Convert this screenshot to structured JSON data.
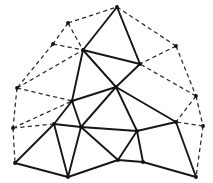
{
  "figure": {
    "type": "planar-triangulation",
    "width": 213,
    "height": 183,
    "background_color": "#ffffff"
  },
  "style": {
    "solid_edge_color": "#171717",
    "solid_edge_width": 1.9,
    "dashed_edge_color": "#2a2a2a",
    "dashed_edge_width": 1.25,
    "dash_pattern": "4.2 3.2",
    "vertex_color": "#111111",
    "vertex_radius": 1.9
  },
  "vertices": [
    {
      "id": "v-apex-top",
      "x": 117,
      "y": 7,
      "layer": "inner",
      "marker": true
    },
    {
      "id": "v-upper-left",
      "x": 83,
      "y": 50,
      "layer": "inner",
      "marker": true
    },
    {
      "id": "v-upper-right",
      "x": 140,
      "y": 64,
      "layer": "inner",
      "marker": true
    },
    {
      "id": "v-center",
      "x": 116,
      "y": 87,
      "layer": "inner",
      "marker": true
    },
    {
      "id": "v-mid-left",
      "x": 72,
      "y": 101,
      "layer": "inner",
      "marker": true
    },
    {
      "id": "v-left-lower",
      "x": 54,
      "y": 124,
      "layer": "inner",
      "marker": true
    },
    {
      "id": "v-mid-lower-left",
      "x": 81,
      "y": 127,
      "layer": "inner",
      "marker": true
    },
    {
      "id": "v-mid-lower-right",
      "x": 137,
      "y": 131,
      "layer": "inner",
      "marker": true
    },
    {
      "id": "v-right-lower",
      "x": 176,
      "y": 122,
      "layer": "inner",
      "marker": true
    },
    {
      "id": "v-bottom-left",
      "x": 15,
      "y": 163,
      "layer": "inner",
      "marker": true
    },
    {
      "id": "v-bottom-left-mid",
      "x": 68,
      "y": 177,
      "layer": "inner",
      "marker": true
    },
    {
      "id": "v-bottom-center",
      "x": 118,
      "y": 160,
      "layer": "inner",
      "marker": true
    },
    {
      "id": "v-bottom-right-mid",
      "x": 143,
      "y": 162,
      "layer": "inner",
      "marker": true
    },
    {
      "id": "v-bottom-right",
      "x": 196,
      "y": 177,
      "layer": "inner",
      "marker": true
    },
    {
      "id": "v-outer-top-left",
      "x": 68,
      "y": 23,
      "layer": "outer",
      "marker": true
    },
    {
      "id": "v-outer-left-upper",
      "x": 53,
      "y": 44,
      "layer": "outer",
      "marker": true
    },
    {
      "id": "v-outer-left-mid",
      "x": 17,
      "y": 88,
      "layer": "outer",
      "marker": true
    },
    {
      "id": "v-outer-left-low",
      "x": 13,
      "y": 128,
      "layer": "outer",
      "marker": true
    },
    {
      "id": "v-outer-top-right",
      "x": 176,
      "y": 46,
      "layer": "outer",
      "marker": true
    },
    {
      "id": "v-outer-right-mid",
      "x": 196,
      "y": 96,
      "layer": "outer",
      "marker": true
    },
    {
      "id": "v-outer-right-low",
      "x": 203,
      "y": 126,
      "layer": "outer",
      "marker": true
    }
  ],
  "edges_solid": [
    {
      "from": "v-apex-top",
      "to": "v-upper-left"
    },
    {
      "from": "v-apex-top",
      "to": "v-upper-right"
    },
    {
      "from": "v-upper-left",
      "to": "v-upper-right"
    },
    {
      "from": "v-upper-left",
      "to": "v-center"
    },
    {
      "from": "v-upper-right",
      "to": "v-center"
    },
    {
      "from": "v-upper-left",
      "to": "v-mid-left"
    },
    {
      "from": "v-mid-left",
      "to": "v-center"
    },
    {
      "from": "v-mid-left",
      "to": "v-left-lower"
    },
    {
      "from": "v-mid-left",
      "to": "v-mid-lower-left"
    },
    {
      "from": "v-left-lower",
      "to": "v-mid-lower-left"
    },
    {
      "from": "v-center",
      "to": "v-mid-lower-left"
    },
    {
      "from": "v-center",
      "to": "v-mid-lower-right"
    },
    {
      "from": "v-center",
      "to": "v-right-lower"
    },
    {
      "from": "v-mid-lower-left",
      "to": "v-mid-lower-right"
    },
    {
      "from": "v-mid-lower-right",
      "to": "v-right-lower"
    },
    {
      "from": "v-left-lower",
      "to": "v-bottom-left"
    },
    {
      "from": "v-left-lower",
      "to": "v-bottom-left-mid"
    },
    {
      "from": "v-mid-lower-left",
      "to": "v-bottom-left-mid"
    },
    {
      "from": "v-mid-lower-left",
      "to": "v-bottom-center"
    },
    {
      "from": "v-bottom-left",
      "to": "v-bottom-left-mid"
    },
    {
      "from": "v-bottom-left-mid",
      "to": "v-bottom-center"
    },
    {
      "from": "v-bottom-center",
      "to": "v-mid-lower-right"
    },
    {
      "from": "v-bottom-center",
      "to": "v-bottom-right-mid"
    },
    {
      "from": "v-mid-lower-right",
      "to": "v-bottom-right-mid"
    },
    {
      "from": "v-bottom-right-mid",
      "to": "v-bottom-right"
    },
    {
      "from": "v-right-lower",
      "to": "v-bottom-right"
    }
  ],
  "edges_dashed": [
    {
      "from": "v-outer-top-left",
      "to": "v-apex-top"
    },
    {
      "from": "v-outer-top-left",
      "to": "v-upper-left"
    },
    {
      "from": "v-outer-top-left",
      "to": "v-outer-left-upper"
    },
    {
      "from": "v-outer-left-upper",
      "to": "v-upper-left"
    },
    {
      "from": "v-outer-left-upper",
      "to": "v-outer-left-mid"
    },
    {
      "from": "v-outer-left-mid",
      "to": "v-upper-left"
    },
    {
      "from": "v-outer-left-mid",
      "to": "v-mid-left"
    },
    {
      "from": "v-outer-left-mid",
      "to": "v-outer-left-low"
    },
    {
      "from": "v-outer-left-low",
      "to": "v-mid-left"
    },
    {
      "from": "v-outer-left-low",
      "to": "v-left-lower"
    },
    {
      "from": "v-outer-left-low",
      "to": "v-bottom-left"
    },
    {
      "from": "v-apex-top",
      "to": "v-outer-top-right"
    },
    {
      "from": "v-apex-top",
      "to": "v-upper-right"
    },
    {
      "from": "v-outer-top-right",
      "to": "v-upper-right"
    },
    {
      "from": "v-outer-top-right",
      "to": "v-outer-right-mid"
    },
    {
      "from": "v-outer-right-mid",
      "to": "v-upper-right"
    },
    {
      "from": "v-outer-right-mid",
      "to": "v-right-lower"
    },
    {
      "from": "v-outer-right-mid",
      "to": "v-outer-right-low"
    },
    {
      "from": "v-outer-right-low",
      "to": "v-right-lower"
    },
    {
      "from": "v-outer-right-low",
      "to": "v-bottom-right"
    }
  ]
}
